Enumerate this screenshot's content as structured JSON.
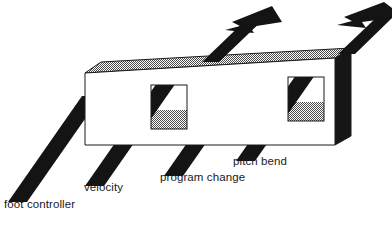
{
  "figure": {
    "box": {
      "name": "device-box",
      "top_face_fill": "#c9c9c9",
      "front_face_fill": "#ffffff",
      "side_face_fill": "#161616",
      "outline_color": "#1a1a1a"
    },
    "slot_fill_upper": "#ffffff",
    "slot_fill_lower": "#bdbdbd",
    "band_color": "#141414",
    "labels": {
      "foot_controller": "foot controller",
      "velocity": "velocity",
      "program_change": "program change",
      "pitch_bend": "pitch bend"
    },
    "icon_names": {
      "band_1": "foot-controller-band-icon",
      "band_2": "velocity-band-icon",
      "band_3": "program-change-band-icon",
      "band_4": "pitch-bend-band-icon",
      "arrow_1": "output-arrow-icon",
      "arrow_2": "output-arrow-icon"
    }
  }
}
